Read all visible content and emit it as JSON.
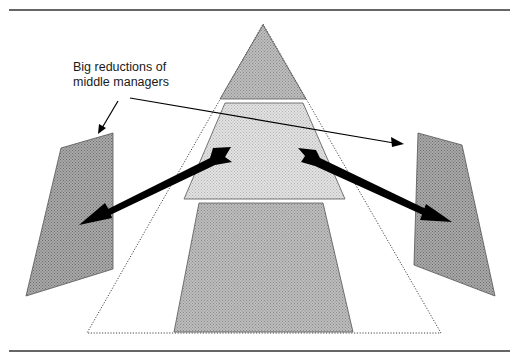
{
  "figure": {
    "annotation": {
      "line1": "Big reductions of",
      "line2": "middle managers"
    },
    "colors": {
      "rule": "#333333",
      "outline": "#555555",
      "fill_dark": "#9a9a9a",
      "fill_dark_dot": "#777777",
      "fill_light": "#d6d6d6",
      "fill_light_dot": "#b8b8b8",
      "arrow": "#000000",
      "text": "#1a1a1a"
    },
    "shapes": {
      "top_tier": "pyramid top (upper management)",
      "middle_tier": "pyramid middle (middle management)",
      "bottom_tier": "pyramid base (workforce)",
      "outer_outline": "dotted pyramid outline",
      "left_panel": "left side panel",
      "right_panel": "right side panel"
    }
  }
}
